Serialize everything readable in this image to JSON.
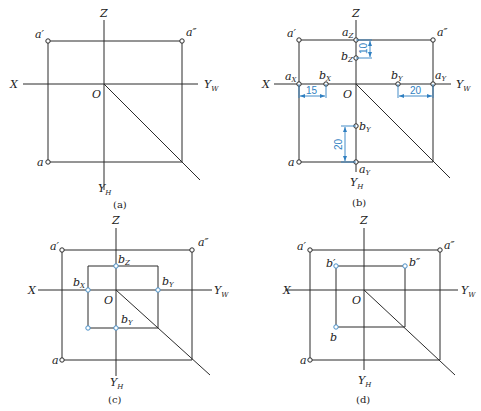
{
  "figure": {
    "captions": {
      "a": "(a)",
      "b": "(b)",
      "c": "(c)",
      "d": "(d)"
    },
    "axis_labels": {
      "x": "X",
      "z": "Z",
      "o": "O",
      "y": "Y",
      "w": "W",
      "h": "H"
    },
    "point_labels": {
      "a_prime": "a′",
      "a_dprime": "a″",
      "a": "a",
      "a_main": "a",
      "b_main": "b",
      "b_prime": "b′",
      "b_dprime": "b″",
      "sub_z": "Z",
      "sub_x": "X",
      "sub_y": "Y"
    },
    "dimensions": {
      "dz": "10",
      "dx": "15",
      "dyw": "20",
      "dyh": "20"
    },
    "colors": {
      "line": "#2b2b2b",
      "highlight": "#4a90c8",
      "dimension": "#2f7fc1"
    }
  }
}
